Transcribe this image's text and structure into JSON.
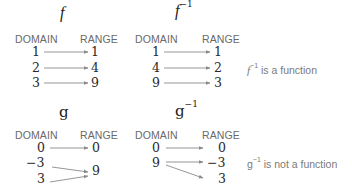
{
  "diagrams": {
    "f": {
      "title": "f",
      "domain_label": "DOMAIN",
      "range_label": "RANGE",
      "domain": [
        "1",
        "2",
        "3"
      ],
      "range": [
        "1",
        "4",
        "9"
      ],
      "mappings": [
        [
          "1",
          "1"
        ],
        [
          "2",
          "4"
        ],
        [
          "3",
          "9"
        ]
      ]
    },
    "f_inv": {
      "title": "f",
      "title_sup": "−1",
      "domain_label": "DOMAIN",
      "range_label": "RANGE",
      "domain": [
        "1",
        "4",
        "9"
      ],
      "range": [
        "1",
        "2",
        "3"
      ],
      "mappings": [
        [
          "1",
          "1"
        ],
        [
          "4",
          "2"
        ],
        [
          "9",
          "3"
        ]
      ],
      "note_sym": "f",
      "note_sup": "−1",
      "note_text": " is a function"
    },
    "g": {
      "title": "g",
      "domain_label": "DOMAIN",
      "range_label": "RANGE",
      "domain": [
        "0",
        "−3",
        "3"
      ],
      "range": [
        "0",
        "9"
      ],
      "mappings": [
        [
          "0",
          "0"
        ],
        [
          "−3",
          "9"
        ],
        [
          "3",
          "9"
        ]
      ]
    },
    "g_inv": {
      "title": "g",
      "title_sup": "−1",
      "domain_label": "DOMAIN",
      "range_label": "RANGE",
      "domain": [
        "0",
        "9"
      ],
      "range": [
        "0",
        "−3",
        "3"
      ],
      "mappings": [
        [
          "0",
          "0"
        ],
        [
          "9",
          "−3"
        ],
        [
          "9",
          "3"
        ]
      ],
      "note_sym": "g",
      "note_sup": "−1",
      "note_text": " is not a function"
    }
  },
  "colors": {
    "arrow": "#8a8a8a",
    "text": "#2a2a2a",
    "label": "#6a6a6a"
  }
}
